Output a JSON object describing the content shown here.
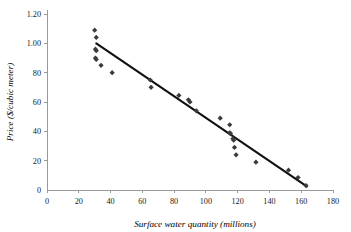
{
  "chart_data": {
    "type": "scatter",
    "title": "",
    "xlabel": "Surface water quantity (millions)",
    "ylabel": "Price ($/cubic meter)",
    "xlim": [
      0,
      180
    ],
    "ylim": [
      0,
      1.2
    ],
    "grid": false,
    "legend": null,
    "x_ticks": [
      0,
      20,
      40,
      60,
      80,
      100,
      120,
      140,
      160,
      180
    ],
    "x_tick_labels": [
      "0",
      "20",
      "40",
      "60",
      "80",
      "100",
      "120",
      "140",
      "160",
      "180"
    ],
    "y_ticks": [
      0,
      0.2,
      0.4,
      0.6,
      0.8,
      1.0,
      1.2
    ],
    "y_tick_labels": [
      "0",
      "20",
      "40",
      "60",
      "80",
      "1.00",
      "1.20"
    ],
    "marker": "diamond",
    "marker_color": "#3b3b3b",
    "line_color": "#111111",
    "points": [
      {
        "x": 30.0,
        "y": 1.09
      },
      {
        "x": 31.0,
        "y": 1.04
      },
      {
        "x": 30.5,
        "y": 0.96
      },
      {
        "x": 31.0,
        "y": 0.95
      },
      {
        "x": 30.5,
        "y": 0.9
      },
      {
        "x": 31.0,
        "y": 0.89
      },
      {
        "x": 34.0,
        "y": 0.85
      },
      {
        "x": 41.0,
        "y": 0.8
      },
      {
        "x": 65.0,
        "y": 0.75
      },
      {
        "x": 65.5,
        "y": 0.7
      },
      {
        "x": 83.0,
        "y": 0.645
      },
      {
        "x": 89.0,
        "y": 0.615
      },
      {
        "x": 90.0,
        "y": 0.6
      },
      {
        "x": 94.0,
        "y": 0.54
      },
      {
        "x": 109.0,
        "y": 0.49
      },
      {
        "x": 115.0,
        "y": 0.445
      },
      {
        "x": 115.0,
        "y": 0.39
      },
      {
        "x": 115.5,
        "y": 0.385
      },
      {
        "x": 117.0,
        "y": 0.35
      },
      {
        "x": 117.5,
        "y": 0.34
      },
      {
        "x": 118.0,
        "y": 0.29
      },
      {
        "x": 119.0,
        "y": 0.24
      },
      {
        "x": 131.5,
        "y": 0.19
      },
      {
        "x": 152.0,
        "y": 0.135
      },
      {
        "x": 158.0,
        "y": 0.085
      },
      {
        "x": 163.0,
        "y": 0.03
      }
    ],
    "trend_line": {
      "x_start": 31.0,
      "y_start": 1.0,
      "x_end": 163.5,
      "y_end": 0.025
    }
  }
}
